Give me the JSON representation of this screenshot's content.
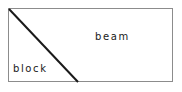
{
  "figure": {
    "name": "beam-on-block-diagram",
    "width": 182,
    "height": 92,
    "background_color": "#ffffff",
    "frame": {
      "stroke_color": "#8c8c8c",
      "stroke_width": 1,
      "x": 8,
      "y": 8,
      "width": 165,
      "height": 74
    },
    "diagonal": {
      "name": "beam-underside-edge",
      "stroke_color": "#1a1a1a",
      "stroke_width": 2,
      "x1": 9,
      "y1": 9,
      "x2": 78,
      "y2": 82
    },
    "labels": {
      "beam": "beam",
      "block": "block"
    },
    "label_color": "#1a1a1a"
  }
}
